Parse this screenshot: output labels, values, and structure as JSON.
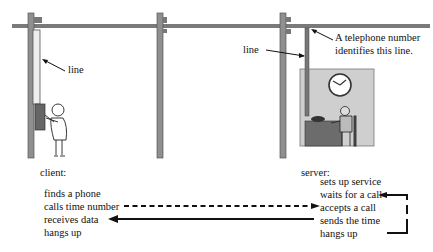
{
  "labels": {
    "line_left": "line",
    "line_right": "line",
    "telephone_note_1": "A telephone number",
    "telephone_note_2": "identifies this line.",
    "client_heading": "client:",
    "server_heading": "server:"
  },
  "client_steps": [
    "finds a phone",
    "calls time number",
    "receives data",
    "hangs up"
  ],
  "server_steps": [
    "sets up service",
    "waits for a call",
    "accepts a call",
    "sends the time",
    "hangs up"
  ],
  "colors": {
    "pole": "#8a8a8a",
    "pole_dark": "#555555",
    "room": "#cfcfcf",
    "ink": "#111111"
  }
}
